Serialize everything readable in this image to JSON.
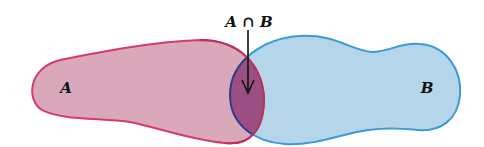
{
  "diagram": {
    "type": "venn",
    "sets": [
      {
        "id": "A",
        "label": "A",
        "fill": "#d9a9bb",
        "stroke": "#d63a6a"
      },
      {
        "id": "B",
        "label": "B",
        "fill": "#b5d6ea",
        "stroke": "#3a9bd6"
      }
    ],
    "intersection": {
      "label": "A ∩ B",
      "fill": "#9b4f82",
      "stroke": "#2a3f8a"
    },
    "arrow": {
      "from_label": "A ∩ B",
      "points_to": "intersection"
    }
  }
}
